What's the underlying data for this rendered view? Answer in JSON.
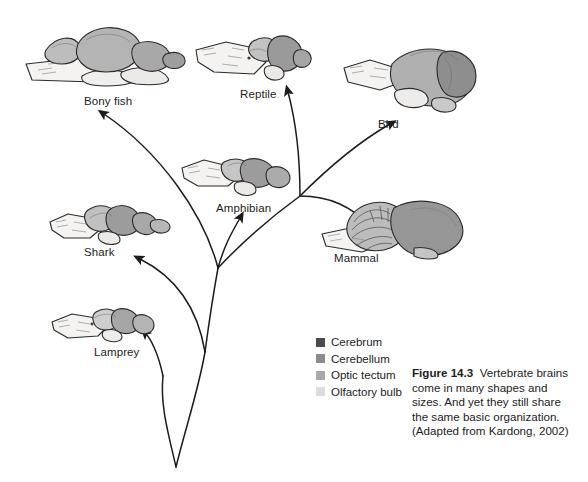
{
  "figure": {
    "number_label": "Figure 14.3",
    "caption_text": "Vertebrate brains come in many shapes and sizes. And yet they still share the same basic organization. (Adapted from Kardong, 2002)"
  },
  "species": [
    {
      "key": "bony-fish",
      "label": "Bony fish"
    },
    {
      "key": "reptile",
      "label": "Reptile"
    },
    {
      "key": "bird",
      "label": "Bird"
    },
    {
      "key": "amphibian",
      "label": "Amphibian"
    },
    {
      "key": "mammal",
      "label": "Mammal"
    },
    {
      "key": "shark",
      "label": "Shark"
    },
    {
      "key": "lamprey",
      "label": "Lamprey"
    }
  ],
  "legend": {
    "items": [
      {
        "label": "Cerebrum",
        "color": "#4a4a4a"
      },
      {
        "label": "Cerebellum",
        "color": "#8c8c8c"
      },
      {
        "label": "Optic tectum",
        "color": "#a9a9a9"
      },
      {
        "label": "Olfactory bulb",
        "color": "#dcdcdc"
      }
    ]
  },
  "colors": {
    "ink": "#1c1c1c",
    "outline": "#2b2b2b",
    "pale": "#f2f1ef",
    "mid": "#bdbdbd",
    "dark": "#8f8f8f"
  }
}
